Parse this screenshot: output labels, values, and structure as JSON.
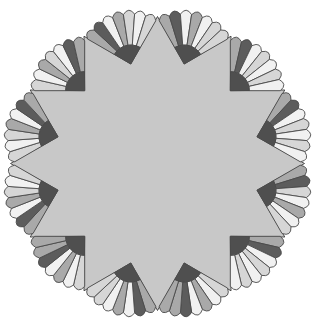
{
  "image": {
    "description": "Quilt block: twelve-pointed gray star with twelve striped fans",
    "width": 313,
    "height": 324
  },
  "geometry": {
    "center": [
      157.5,
      163.5
    ],
    "star_points": 12,
    "tip_radius": 147,
    "notch_radius": 103,
    "fan_hub_radius": 19,
    "fan_outer_radius": 54,
    "fan_span_deg": 90,
    "blades_per_fan": 7
  },
  "colors": {
    "background": "#ffffff",
    "star_fill": "#c8c8c8",
    "outline": "#4a4a4a",
    "hub": "#4f4f4f",
    "shades": {
      "dark": "#5c5c5c",
      "mid_dark": "#7e7e7e",
      "mid": "#a9a9a9",
      "light": "#d6d6d6",
      "white": "#f1f1f1"
    }
  },
  "fans": [
    {
      "blades": [
        "mid",
        "dark",
        "white",
        "light",
        "white",
        "light",
        "white"
      ]
    },
    {
      "blades": [
        "mid",
        "dark",
        "white",
        "light",
        "white",
        "light",
        "white"
      ]
    },
    {
      "blades": [
        "mid",
        "dark",
        "white",
        "mid",
        "white",
        "light",
        "light"
      ]
    },
    {
      "blades": [
        "mid",
        "dark",
        "white",
        "mid",
        "light",
        "white",
        "light"
      ]
    },
    {
      "blades": [
        "light",
        "white",
        "mid",
        "light",
        "white",
        "dark",
        "mid"
      ]
    },
    {
      "blades": [
        "light",
        "white",
        "light",
        "mid",
        "white",
        "dark",
        "mid"
      ]
    },
    {
      "blades": [
        "mid",
        "dark",
        "white",
        "mid",
        "light",
        "white",
        "light"
      ]
    },
    {
      "blades": [
        "light",
        "white",
        "mid",
        "white",
        "dark",
        "mid",
        "mid"
      ]
    },
    {
      "blades": [
        "mid",
        "dark",
        "white",
        "mid",
        "white",
        "light",
        "light"
      ]
    },
    {
      "blades": [
        "light",
        "white",
        "mid",
        "white",
        "dark",
        "mid",
        "mid"
      ]
    },
    {
      "blades": [
        "mid",
        "dark",
        "white",
        "light",
        "white",
        "light",
        "white"
      ]
    },
    {
      "blades": [
        "mid",
        "dark",
        "light",
        "white",
        "mid",
        "white",
        "light"
      ]
    }
  ]
}
